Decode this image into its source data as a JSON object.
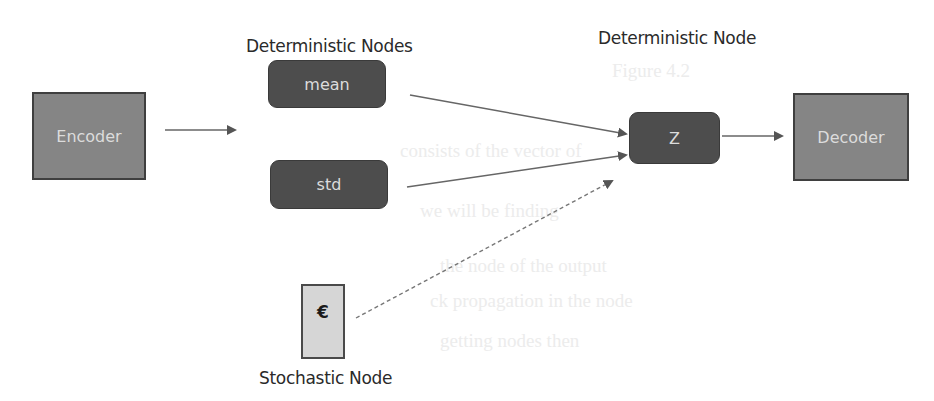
{
  "diagram": {
    "labels": {
      "deterministic_nodes": "Deterministic Nodes",
      "deterministic_node": "Deterministic Node",
      "stochastic_node": "Stochastic Node"
    },
    "nodes": {
      "encoder": "Encoder",
      "mean": "mean",
      "std": "std",
      "z": "Z",
      "decoder": "Decoder",
      "epsilon": "€"
    },
    "edges": [
      {
        "from": "encoder",
        "to": "mean/std",
        "style": "solid"
      },
      {
        "from": "mean",
        "to": "z",
        "style": "solid"
      },
      {
        "from": "std",
        "to": "z",
        "style": "solid"
      },
      {
        "from": "epsilon",
        "to": "z",
        "style": "dashed"
      },
      {
        "from": "z",
        "to": "decoder",
        "style": "solid"
      }
    ],
    "colors": {
      "square_fill": "#858585",
      "rounded_fill": "#4d4d4d",
      "stochastic_fill": "#d6d6d6",
      "edge": "#555555"
    }
  }
}
